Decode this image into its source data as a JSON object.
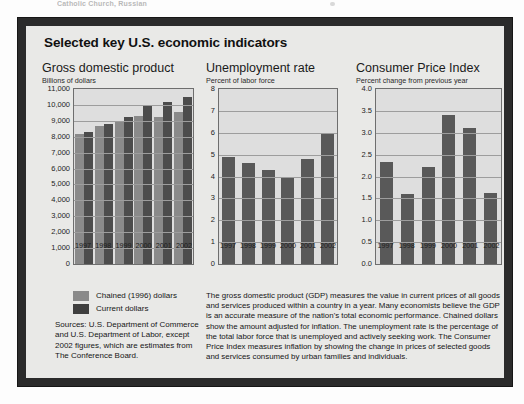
{
  "scan": {
    "top_text_fragment": "Catholic Church, Russian"
  },
  "figure": {
    "title": "Selected key U.S. economic indicators",
    "legend": [
      {
        "key": "chained",
        "label": "Chained (1996) dollars",
        "color": "#8a8a8a"
      },
      {
        "key": "current",
        "label": "Current dollars",
        "color": "#3f3f3f"
      }
    ],
    "sources": "Sources: U.S. Department of Commerce and U.S. Department of Labor, except 2002 figures, which are estimates from The Conference Board.",
    "description": "The gross domestic product (GDP) measures the value in current prices of all goods and services produced within a country in a year. Many economists believe the GDP is an accurate measure of the nation's total economic performance. Chained dollars show the amount adjusted for inflation. The unemployment rate is the percentage of the total labor force that is unemployed and actively seeking work. The Consumer Price Index measures inflation by showing the change in prices of selected goods and services consumed by urban families and individuals."
  },
  "chart_data": [
    {
      "type": "bar",
      "id": "gdp",
      "title": "Gross domestic product",
      "subtitle": "Billions of dollars",
      "xlabel": "",
      "ylabel": "Billions of dollars",
      "categories": [
        "1997",
        "1998",
        "1999",
        "2000",
        "2001",
        "2002"
      ],
      "series": [
        {
          "name": "Chained (1996) dollars",
          "color": "#8a8a8a",
          "values": [
            8160,
            8660,
            8940,
            9280,
            9260,
            9580
          ]
        },
        {
          "name": "Current dollars",
          "color": "#4c4c4c",
          "values": [
            8280,
            8770,
            9220,
            9930,
            10180,
            10520
          ]
        }
      ],
      "ylim": [
        0,
        11000
      ],
      "yticks": [
        "0",
        "1,000",
        "2,000",
        "3,000",
        "4,000",
        "5,000",
        "6,000",
        "7,000",
        "8,000",
        "9,000",
        "10,000",
        "11,000"
      ],
      "grid": true,
      "legend_position": "below-left"
    },
    {
      "type": "bar",
      "id": "unemployment",
      "title": "Unemployment rate",
      "subtitle": "Percent of labor force",
      "xlabel": "",
      "ylabel": "Percent of labor force",
      "categories": [
        "1997",
        "1998",
        "1999",
        "2000",
        "2001",
        "2002"
      ],
      "values": [
        4.9,
        4.6,
        4.3,
        4.0,
        4.8,
        6.0
      ],
      "series_color": "#595959",
      "ylim": [
        0,
        8
      ],
      "yticks": [
        "0",
        "1",
        "2",
        "3",
        "4",
        "5",
        "6",
        "7",
        "8"
      ],
      "grid": true,
      "legend_position": "none"
    },
    {
      "type": "bar",
      "id": "cpi",
      "title": "Consumer Price Index",
      "subtitle": "Percent change from previous year",
      "xlabel": "",
      "ylabel": "Percent change from previous year",
      "categories": [
        "1997",
        "1998",
        "1999",
        "2000",
        "2001",
        "2002"
      ],
      "values": [
        2.34,
        1.6,
        2.22,
        3.4,
        3.1,
        1.62
      ],
      "series_color": "#595959",
      "ylim": [
        0,
        4.0
      ],
      "yticks": [
        "0.0",
        "0.5",
        "1.0",
        "1.5",
        "2.0",
        "2.5",
        "3.0",
        "3.5",
        "4.0"
      ],
      "grid": true,
      "legend_position": "none"
    }
  ]
}
